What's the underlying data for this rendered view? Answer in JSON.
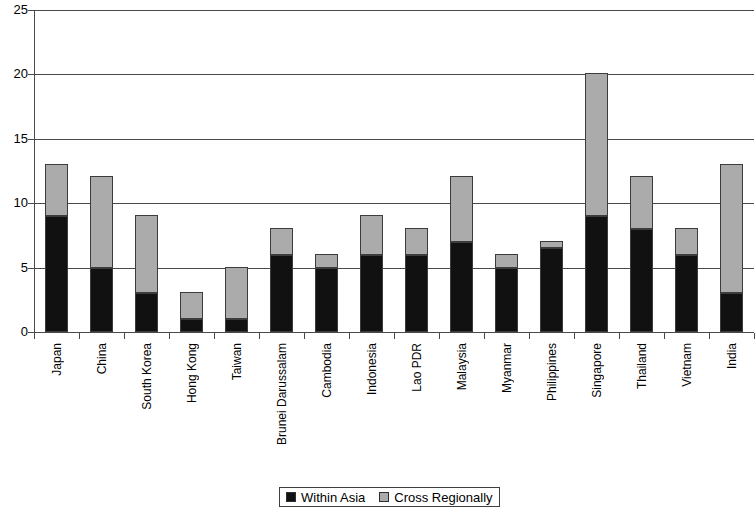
{
  "chart_data": {
    "type": "bar",
    "subtype": "stacked-vertical",
    "title": "",
    "xlabel": "",
    "ylabel": "",
    "ylim": [
      0,
      25
    ],
    "ytick_values": [
      0,
      5,
      10,
      15,
      20,
      25
    ],
    "ytick_labels": [
      "0",
      "5",
      "10",
      "15",
      "20",
      "25"
    ],
    "grid": "horizontal",
    "legend_position": "bottom-center",
    "categories": [
      "Japan",
      "China",
      "South Korea",
      "Hong Kong",
      "Taiwan",
      "Brunei Darussalam",
      "Cambodia",
      "Indonesia",
      "Lao PDR",
      "Malaysia",
      "Myanmar",
      "Philippines",
      "Singapore",
      "Thailand",
      "Vietnam",
      "India"
    ],
    "series": [
      {
        "name": "Within Asia",
        "color": "#111111",
        "values": [
          9,
          5,
          3,
          1,
          1,
          6,
          5,
          6,
          6,
          7,
          5,
          6.5,
          9,
          8,
          6,
          3
        ]
      },
      {
        "name": "Cross Regionally",
        "color": "#ababab",
        "values": [
          4,
          7,
          6,
          2,
          4,
          2,
          1,
          3,
          2,
          5,
          1,
          0.5,
          11,
          4,
          2,
          10
        ]
      }
    ],
    "totals": [
      13,
      12,
      9,
      3,
      5,
      8,
      6,
      9,
      8,
      12,
      6,
      7,
      20,
      12,
      8,
      13
    ]
  },
  "legend": {
    "items": [
      {
        "label": "Within Asia",
        "swatch": "within-asia-swatch"
      },
      {
        "label": "Cross Regionally",
        "swatch": "cross-regionally-swatch"
      }
    ]
  }
}
